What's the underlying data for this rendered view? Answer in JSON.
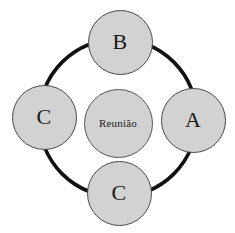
{
  "diagram": {
    "type": "radial-cycle-diagram",
    "canvas": {
      "width": 235,
      "height": 233,
      "background": "#ffffff"
    },
    "ring": {
      "name": "connector-ring",
      "center_x": 118,
      "center_y": 118,
      "radius": 79,
      "stroke_color": "#111111",
      "stroke_width": 3.6
    },
    "center_node": {
      "label": "Reunião",
      "cx": 118,
      "cy": 123,
      "diameter": 69,
      "fill": "#d2d2d2",
      "stroke": "#555555"
    },
    "nodes": [
      {
        "id": "node-top",
        "label": "B",
        "cx": 120,
        "cy": 42,
        "diameter": 65,
        "fill": "#d2d2d2",
        "stroke": "#4a4a4a"
      },
      {
        "id": "node-right",
        "label": "A",
        "cx": 193,
        "cy": 120,
        "diameter": 65,
        "fill": "#d2d2d2",
        "stroke": "#4a4a4a"
      },
      {
        "id": "node-bottom",
        "label": "C",
        "cx": 119,
        "cy": 193,
        "diameter": 65,
        "fill": "#d2d2d2",
        "stroke": "#4a4a4a"
      },
      {
        "id": "node-left",
        "label": "C",
        "cx": 44,
        "cy": 117,
        "diameter": 65,
        "fill": "#d2d2d2",
        "stroke": "#4a4a4a"
      }
    ]
  }
}
